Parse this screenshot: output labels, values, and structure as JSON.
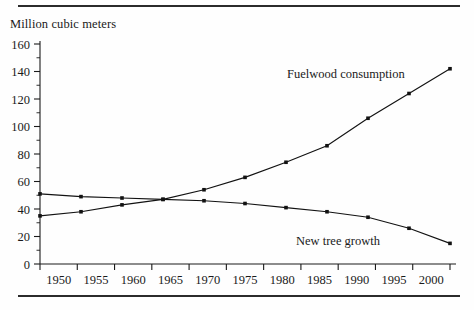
{
  "axis_title": "Million cubic meters",
  "colors": {
    "ink": "#1a1a1a",
    "line": "#121212",
    "rule": "#2b2b2b"
  },
  "annotations": {
    "fuelwood_label": "Fuelwood consumption",
    "newtree_label": "New tree growth"
  },
  "chart_data": {
    "type": "line",
    "title": "",
    "subtitle": "",
    "xlabel": "",
    "ylabel": "Million cubic meters",
    "categories": [
      "1950",
      "1955",
      "1960",
      "1965",
      "1970",
      "1975",
      "1980",
      "1985",
      "1990",
      "1995",
      "2000"
    ],
    "x": [
      1950,
      1955,
      1960,
      1965,
      1970,
      1975,
      1980,
      1985,
      1990,
      1995,
      2000
    ],
    "xlim": [
      1950,
      2000
    ],
    "ylim": [
      0,
      160
    ],
    "y_ticks": [
      0,
      20,
      40,
      60,
      80,
      100,
      120,
      140,
      160
    ],
    "y_minor_step": 10,
    "grid": false,
    "legend_position": "inline-annotations",
    "series": [
      {
        "name": "Fuelwood consumption",
        "values": [
          35,
          38,
          43,
          47,
          54,
          63,
          74,
          86,
          106,
          124,
          142
        ]
      },
      {
        "name": "New tree growth",
        "values": [
          51,
          49,
          48,
          47,
          46,
          44,
          41,
          38,
          34,
          26,
          15
        ]
      }
    ]
  }
}
